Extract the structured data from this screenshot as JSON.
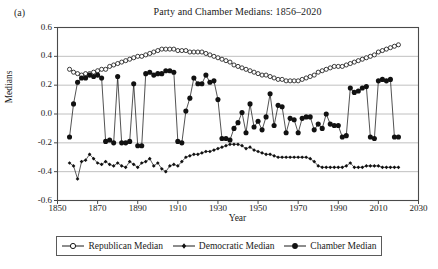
{
  "figure": {
    "panel_label": "(a)",
    "background": "#ffffff",
    "line_color": "#1a1a1a",
    "grid_color": "#b9b9b9",
    "axis_color": "#4a4a4a"
  },
  "legend": {
    "position": "below-axis",
    "entries": [
      {
        "label": "Republican Median",
        "marker": "open-circle",
        "key_name": "legend-key-republican"
      },
      {
        "label": "Democratic Median",
        "marker": "small-filled-diamond",
        "key_name": "legend-key-democratic"
      },
      {
        "label": "Chamber Median",
        "marker": "filled-circle",
        "key_name": "legend-key-chamber"
      }
    ]
  },
  "chart_data": {
    "type": "line",
    "title": "Party and Chamber Medians: 1856–2020",
    "xlabel": "Year",
    "ylabel": "Medians",
    "xlim": [
      1850,
      2030
    ],
    "ylim": [
      -0.6,
      0.6
    ],
    "xticks": [
      1850,
      1870,
      1890,
      1910,
      1930,
      1950,
      1970,
      1990,
      2010,
      2030
    ],
    "yticks": [
      0.6,
      0.4,
      0.2,
      0.0,
      -0.2,
      -0.4,
      -0.6
    ],
    "ytick_labels": [
      "0.6",
      "0.4",
      "0.2",
      "0.0",
      "-0.2",
      "-0.4",
      "-0.6"
    ],
    "xtick_labels": [
      "1850",
      "1870",
      "1890",
      "1910",
      "1930",
      "1950",
      "1970",
      "1990",
      "2010",
      "2030"
    ],
    "grid": "horizontal",
    "x": [
      1856,
      1858,
      1860,
      1862,
      1864,
      1866,
      1868,
      1870,
      1872,
      1874,
      1876,
      1878,
      1880,
      1882,
      1884,
      1886,
      1888,
      1890,
      1892,
      1894,
      1896,
      1898,
      1900,
      1902,
      1904,
      1906,
      1908,
      1910,
      1912,
      1914,
      1916,
      1918,
      1920,
      1922,
      1924,
      1926,
      1928,
      1930,
      1932,
      1934,
      1936,
      1938,
      1940,
      1942,
      1944,
      1946,
      1948,
      1950,
      1952,
      1954,
      1956,
      1958,
      1960,
      1962,
      1964,
      1966,
      1968,
      1970,
      1972,
      1974,
      1976,
      1978,
      1980,
      1982,
      1984,
      1986,
      1988,
      1990,
      1992,
      1994,
      1996,
      1998,
      2000,
      2002,
      2004,
      2006,
      2008,
      2010,
      2012,
      2014,
      2016,
      2018,
      2020
    ],
    "series": [
      {
        "name": "Republican Median",
        "marker": "open-circle",
        "values": [
          0.31,
          0.29,
          0.28,
          0.27,
          0.28,
          0.28,
          0.29,
          0.3,
          0.31,
          0.31,
          0.33,
          0.34,
          0.35,
          0.36,
          0.37,
          0.38,
          0.39,
          0.4,
          0.4,
          0.41,
          0.42,
          0.43,
          0.44,
          0.45,
          0.45,
          0.45,
          0.45,
          0.44,
          0.44,
          0.44,
          0.43,
          0.43,
          0.43,
          0.43,
          0.42,
          0.41,
          0.4,
          0.39,
          0.38,
          0.37,
          0.36,
          0.34,
          0.33,
          0.32,
          0.31,
          0.3,
          0.29,
          0.28,
          0.27,
          0.27,
          0.26,
          0.25,
          0.24,
          0.24,
          0.23,
          0.23,
          0.23,
          0.23,
          0.24,
          0.25,
          0.26,
          0.27,
          0.29,
          0.3,
          0.31,
          0.32,
          0.33,
          0.33,
          0.33,
          0.34,
          0.35,
          0.36,
          0.37,
          0.38,
          0.39,
          0.4,
          0.41,
          0.43,
          0.44,
          0.45,
          0.46,
          0.47,
          0.48
        ]
      },
      {
        "name": "Democratic Median",
        "marker": "small-filled-diamond",
        "values": [
          -0.34,
          -0.36,
          -0.45,
          -0.33,
          -0.32,
          -0.28,
          -0.31,
          -0.34,
          -0.35,
          -0.33,
          -0.35,
          -0.36,
          -0.34,
          -0.36,
          -0.37,
          -0.33,
          -0.35,
          -0.37,
          -0.34,
          -0.33,
          -0.31,
          -0.36,
          -0.34,
          -0.38,
          -0.4,
          -0.36,
          -0.35,
          -0.36,
          -0.33,
          -0.3,
          -0.29,
          -0.28,
          -0.28,
          -0.27,
          -0.26,
          -0.26,
          -0.25,
          -0.24,
          -0.23,
          -0.22,
          -0.21,
          -0.21,
          -0.21,
          -0.22,
          -0.24,
          -0.23,
          -0.25,
          -0.26,
          -0.27,
          -0.28,
          -0.28,
          -0.29,
          -0.3,
          -0.3,
          -0.3,
          -0.3,
          -0.3,
          -0.3,
          -0.3,
          -0.3,
          -0.31,
          -0.33,
          -0.36,
          -0.37,
          -0.37,
          -0.37,
          -0.37,
          -0.37,
          -0.37,
          -0.36,
          -0.34,
          -0.37,
          -0.37,
          -0.37,
          -0.36,
          -0.36,
          -0.36,
          -0.36,
          -0.37,
          -0.37,
          -0.37,
          -0.37,
          -0.37
        ]
      },
      {
        "name": "Chamber Median",
        "marker": "filled-circle",
        "values": [
          -0.16,
          0.07,
          0.22,
          0.25,
          0.25,
          0.27,
          0.26,
          0.27,
          0.25,
          -0.19,
          -0.18,
          -0.2,
          0.26,
          -0.2,
          -0.2,
          -0.19,
          0.21,
          -0.22,
          -0.22,
          0.28,
          0.29,
          0.27,
          0.28,
          0.28,
          0.3,
          0.3,
          0.29,
          -0.19,
          -0.2,
          0.02,
          0.11,
          0.25,
          0.21,
          0.21,
          0.27,
          0.22,
          0.23,
          0.1,
          -0.17,
          -0.17,
          -0.18,
          -0.1,
          -0.06,
          0.01,
          -0.13,
          0.07,
          -0.09,
          -0.05,
          -0.11,
          -0.02,
          0.14,
          -0.08,
          0.06,
          0.05,
          -0.13,
          -0.03,
          -0.04,
          -0.13,
          -0.03,
          -0.02,
          -0.02,
          -0.11,
          -0.07,
          -0.1,
          0.0,
          -0.07,
          -0.08,
          -0.08,
          -0.16,
          -0.15,
          0.18,
          0.15,
          0.16,
          0.18,
          0.19,
          -0.16,
          -0.17,
          0.23,
          0.24,
          0.23,
          0.24,
          -0.16,
          -0.16
        ]
      }
    ]
  }
}
